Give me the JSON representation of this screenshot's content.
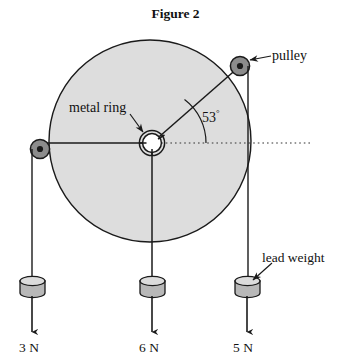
{
  "figure": {
    "title": "Figure 2",
    "caption_position": "top-center"
  },
  "labels": {
    "pulley": "pulley",
    "metal_ring": "metal ring",
    "lead_weight": "lead weight",
    "angle_value": "53",
    "angle_degree_symbol": "°"
  },
  "forces": [
    {
      "id": "left",
      "label": "3 N",
      "magnitude": 3,
      "unit": "N",
      "direction": "left-horizontal-then-down"
    },
    {
      "id": "middle",
      "label": "6 N",
      "magnitude": 6,
      "unit": "N",
      "direction": "straight-down"
    },
    {
      "id": "right",
      "label": "5 N",
      "magnitude": 5,
      "unit": "N",
      "direction": "up-right-53-degrees-then-down"
    }
  ],
  "geometry": {
    "disc": {
      "cx": 150,
      "cy": 141,
      "r": 101
    },
    "metal_ring": {
      "cx": 152,
      "cy": 143,
      "r_outer": 13,
      "r_inner": 10
    },
    "pulley_right": {
      "cx": 240,
      "cy": 66,
      "r": 9.5
    },
    "pulley_left": {
      "cx": 40,
      "cy": 149,
      "r": 9.5
    },
    "angle_degrees": 53,
    "string_drop_x_left": 32,
    "string_drop_x_middle": 152,
    "string_drop_x_right": 248,
    "weight_top_y": 277
  },
  "colors": {
    "disc_fill": "#dddddd",
    "disc_stroke": "#1a1a1a",
    "pulley_fill": "#8c8c8c",
    "pulley_hub": "#1a1a1a",
    "weight_fill": "#b8b8b8",
    "weight_top_fill": "#d8d8d8",
    "line": "#1a1a1a",
    "background": "#ffffff"
  },
  "elements": {
    "icons": {
      "pulley_right": "pulley-icon",
      "pulley_left": "pulley-icon",
      "metal_ring": "ring-icon",
      "weight_left": "cylinder-weight-icon",
      "weight_middle": "cylinder-weight-icon",
      "weight_right": "cylinder-weight-icon"
    }
  }
}
